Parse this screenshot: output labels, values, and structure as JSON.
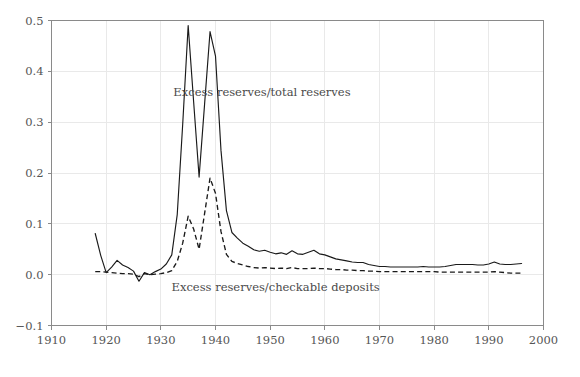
{
  "chart_data": {
    "type": "line",
    "title": "",
    "subtitle": "",
    "xlabel": "",
    "ylabel": "",
    "xlim": [
      1910,
      2000
    ],
    "ylim": [
      -0.1,
      0.5
    ],
    "xticks": [
      1910,
      1920,
      1930,
      1940,
      1950,
      1960,
      1970,
      1980,
      1990,
      2000
    ],
    "xtick_labels": [
      "1910",
      "1920",
      "1930",
      "1940",
      "1950",
      "1960",
      "1970",
      "1980",
      "1990",
      "2000"
    ],
    "yticks": [
      -0.1,
      0.0,
      0.1,
      0.2,
      0.3,
      0.4,
      0.5
    ],
    "ytick_labels": [
      "−0.1",
      "0.0",
      "0.1",
      "0.2",
      "0.3",
      "0.4",
      "0.5"
    ],
    "grid": true,
    "grid_color": "#e9e9e9",
    "legend_position": "inline-annotations",
    "series": [
      {
        "name": "Excess reserves/total reserves",
        "style": "solid",
        "color": "#1a1a1a",
        "annotation": "Excess reserves/total reserves",
        "annotation_x": 1948.5,
        "annotation_y": 0.352,
        "x": [
          1918,
          1919,
          1920,
          1921,
          1922,
          1923,
          1924,
          1925,
          1926,
          1927,
          1928,
          1929,
          1930,
          1931,
          1932,
          1933,
          1934,
          1935,
          1936,
          1937,
          1938,
          1939,
          1940,
          1941,
          1942,
          1943,
          1944,
          1945,
          1946,
          1947,
          1948,
          1949,
          1950,
          1951,
          1952,
          1953,
          1954,
          1955,
          1956,
          1957,
          1958,
          1959,
          1960,
          1961,
          1962,
          1963,
          1964,
          1965,
          1966,
          1967,
          1968,
          1969,
          1970,
          1971,
          1972,
          1973,
          1974,
          1975,
          1976,
          1977,
          1978,
          1979,
          1980,
          1981,
          1982,
          1983,
          1984,
          1985,
          1986,
          1987,
          1988,
          1989,
          1990,
          1991,
          1992,
          1993,
          1994,
          1995,
          1996
        ],
        "y": [
          0.081,
          0.038,
          0.004,
          0.015,
          0.028,
          0.019,
          0.014,
          0.007,
          -0.013,
          0.004,
          0.0,
          0.006,
          0.011,
          0.021,
          0.039,
          0.118,
          0.296,
          0.49,
          0.34,
          0.192,
          0.335,
          0.478,
          0.43,
          0.245,
          0.126,
          0.083,
          0.072,
          0.062,
          0.056,
          0.049,
          0.046,
          0.048,
          0.044,
          0.041,
          0.043,
          0.04,
          0.047,
          0.041,
          0.04,
          0.044,
          0.048,
          0.041,
          0.039,
          0.035,
          0.031,
          0.029,
          0.027,
          0.025,
          0.024,
          0.024,
          0.02,
          0.018,
          0.016,
          0.016,
          0.015,
          0.015,
          0.015,
          0.015,
          0.015,
          0.015,
          0.016,
          0.015,
          0.015,
          0.015,
          0.016,
          0.018,
          0.02,
          0.02,
          0.02,
          0.02,
          0.019,
          0.019,
          0.021,
          0.025,
          0.021,
          0.02,
          0.02,
          0.021,
          0.022
        ]
      },
      {
        "name": "Excess reserves/checkable deposits",
        "style": "dashed",
        "color": "#1a1a1a",
        "annotation": "Excess reserves/checkable deposits",
        "annotation_x": 1951.0,
        "annotation_y": -0.032,
        "x": [
          1918,
          1919,
          1920,
          1921,
          1922,
          1923,
          1924,
          1925,
          1926,
          1927,
          1928,
          1929,
          1930,
          1931,
          1932,
          1933,
          1934,
          1935,
          1936,
          1937,
          1938,
          1939,
          1940,
          1941,
          1942,
          1943,
          1944,
          1945,
          1946,
          1947,
          1948,
          1949,
          1950,
          1951,
          1952,
          1953,
          1954,
          1955,
          1956,
          1957,
          1958,
          1959,
          1960,
          1961,
          1962,
          1963,
          1964,
          1965,
          1966,
          1967,
          1968,
          1969,
          1970,
          1971,
          1972,
          1973,
          1974,
          1975,
          1976,
          1977,
          1978,
          1979,
          1980,
          1981,
          1982,
          1983,
          1984,
          1985,
          1986,
          1987,
          1988,
          1989,
          1990,
          1991,
          1992,
          1993,
          1994,
          1995,
          1996
        ],
        "y": [
          0.006,
          0.006,
          0.005,
          0.004,
          0.003,
          0.002,
          0.002,
          0.001,
          -0.004,
          0.002,
          0.0,
          0.001,
          0.002,
          0.004,
          0.008,
          0.026,
          0.062,
          0.115,
          0.09,
          0.05,
          0.12,
          0.19,
          0.16,
          0.085,
          0.04,
          0.026,
          0.022,
          0.019,
          0.016,
          0.014,
          0.013,
          0.014,
          0.013,
          0.012,
          0.013,
          0.012,
          0.014,
          0.012,
          0.012,
          0.012,
          0.013,
          0.012,
          0.012,
          0.011,
          0.01,
          0.01,
          0.009,
          0.009,
          0.008,
          0.008,
          0.007,
          0.007,
          0.006,
          0.006,
          0.006,
          0.006,
          0.006,
          0.006,
          0.006,
          0.006,
          0.006,
          0.006,
          0.006,
          0.005,
          0.005,
          0.005,
          0.005,
          0.005,
          0.005,
          0.005,
          0.005,
          0.005,
          0.005,
          0.006,
          0.005,
          0.004,
          0.003,
          0.003,
          0.003
        ]
      }
    ]
  }
}
